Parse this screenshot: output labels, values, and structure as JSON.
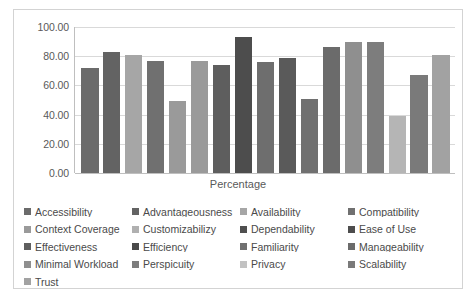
{
  "chart_data": {
    "type": "bar",
    "title": "",
    "xlabel": "Percentage",
    "ylabel": "",
    "ylim": [
      0,
      100
    ],
    "grid": true,
    "legend_position": "bottom",
    "y_ticks": [
      "0.00",
      "20.00",
      "40.00",
      "60.00",
      "80.00",
      "100.00"
    ],
    "y_tick_values": [
      0,
      20,
      40,
      60,
      80,
      100
    ],
    "categories": [
      "Accessibility",
      "Advantageousness",
      "Availability",
      "Compatibility",
      "Context Coverage",
      "Customizabilizy",
      "Dependability",
      "Ease of Use",
      "Effectiveness",
      "Efficiency",
      "Familiarity",
      "Manageability",
      "Minimal Workload",
      "Perspicuity",
      "Privacy",
      "Scalability",
      "Trust"
    ],
    "values": [
      72,
      83,
      81,
      77,
      49,
      77,
      74,
      93,
      76,
      79,
      51,
      86,
      90,
      90,
      39,
      67,
      81
    ],
    "bar_colors": [
      "#6b6b6b",
      "#636363",
      "#a6a6a6",
      "#707070",
      "#9a9a9a",
      "#9a9a9a",
      "#5e5e5e",
      "#4d4d4d",
      "#6e6e6e",
      "#5a5a5a",
      "#707070",
      "#6b6b6b",
      "#8f8f8f",
      "#7d7d7d",
      "#b5b5b5",
      "#7a7a7a",
      "#a2a2a2"
    ]
  },
  "legend": {
    "items": [
      {
        "label": "Accessibility",
        "color": "#6b6b6b"
      },
      {
        "label": "Advantageousness",
        "color": "#636363"
      },
      {
        "label": "Availability",
        "color": "#a6a6a6"
      },
      {
        "label": "Compatibility",
        "color": "#707070"
      },
      {
        "label": "Context Coverage",
        "color": "#9a9a9a"
      },
      {
        "label": "Customizabilizy",
        "color": "#b0b0b0"
      },
      {
        "label": "Dependability",
        "color": "#4f4f4f"
      },
      {
        "label": "Ease of Use",
        "color": "#4d4d4d"
      },
      {
        "label": "Effectiveness",
        "color": "#5f5f5f"
      },
      {
        "label": "Efficiency",
        "color": "#4a4a4a"
      },
      {
        "label": "Familiarity",
        "color": "#707070"
      },
      {
        "label": "Manageability",
        "color": "#6b6b6b"
      },
      {
        "label": "Minimal Workload",
        "color": "#8f8f8f"
      },
      {
        "label": "Perspicuity",
        "color": "#7d7d7d"
      },
      {
        "label": "Privacy",
        "color": "#c2c2c2"
      },
      {
        "label": "Scalability",
        "color": "#7a7a7a"
      },
      {
        "label": "Trust",
        "color": "#a2a2a2"
      }
    ]
  },
  "colors": {
    "grid": "#d9d9d9",
    "axis": "#bfbfbf",
    "frame": "#d3d3d3",
    "text": "#595959",
    "background": "#ffffff"
  }
}
